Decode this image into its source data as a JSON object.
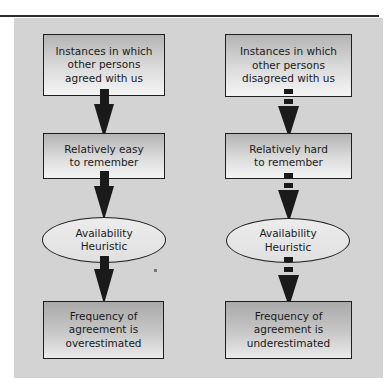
{
  "diagram": {
    "left_column": {
      "label": "agreement path",
      "nodes": [
        {
          "type": "box",
          "text_lines": [
            "Instances in which",
            "other persons",
            "agreed with us"
          ]
        },
        {
          "type": "box",
          "text_lines": [
            "Relatively easy",
            "to remember"
          ]
        },
        {
          "type": "ellipse",
          "text_lines": [
            "Availability",
            "Heuristic"
          ]
        },
        {
          "type": "box",
          "text_lines": [
            "Frequency of",
            "agreement is",
            "overestimated"
          ]
        }
      ],
      "arrow_style": "solid"
    },
    "right_column": {
      "label": "disagreement path",
      "nodes": [
        {
          "type": "box",
          "text_lines": [
            "Instances in which",
            "other persons",
            "disagreed with us"
          ]
        },
        {
          "type": "box",
          "text_lines": [
            "Relatively hard",
            "to remember"
          ]
        },
        {
          "type": "ellipse",
          "text_lines": [
            "Availability",
            "Heuristic"
          ]
        },
        {
          "type": "box",
          "text_lines": [
            "Frequency of",
            "agreement is",
            "underestimated"
          ]
        }
      ],
      "arrow_style": "dashed"
    },
    "colors": {
      "panel_bg": "#d3d3d3",
      "border": "#1e1e1e",
      "arrow": "#1a1a1a"
    }
  }
}
